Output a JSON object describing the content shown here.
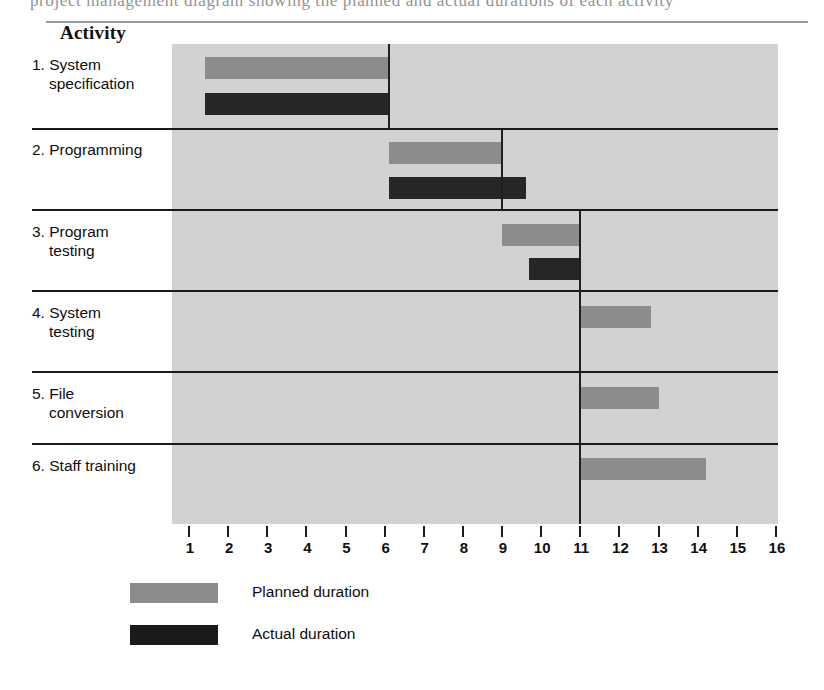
{
  "page": {
    "bleed_text": "project management diagram showing the planned and actual durations of each activity"
  },
  "header": {
    "activity_column_label": "Activity"
  },
  "legend": {
    "planned_label": "Planned duration",
    "actual_label": "Actual duration",
    "planned_color": "#8c8c8c",
    "actual_color": "#1a1a1a"
  },
  "axis": {
    "tick_labels": [
      "1",
      "2",
      "3",
      "4",
      "5",
      "6",
      "7",
      "8",
      "9",
      "10",
      "11",
      "12",
      "13",
      "14",
      "15",
      "16"
    ],
    "min": 1,
    "max": 16
  },
  "activities": [
    {
      "line1": "1. System",
      "line2": "specification"
    },
    {
      "line1": "2. Programming",
      "line2": ""
    },
    {
      "line1": "3. Program",
      "line2": "testing"
    },
    {
      "line1": "4. System",
      "line2": "testing"
    },
    {
      "line1": "5. File",
      "line2": "conversion"
    },
    {
      "line1": "6. Staff training",
      "line2": ""
    }
  ],
  "chart_data": {
    "type": "bar",
    "title": "",
    "xlabel": "",
    "ylabel": "Activity",
    "xlim": [
      1,
      16
    ],
    "grid": false,
    "legend_position": "bottom-left",
    "orientation": "horizontal",
    "categories": [
      "1. System specification",
      "2. Programming",
      "3. Program testing",
      "4. System testing",
      "5. File conversion",
      "6. Staff training"
    ],
    "series": [
      {
        "name": "Planned duration",
        "color": "#8c8c8c",
        "bars": [
          {
            "category": "1. System specification",
            "start": 1.4,
            "end": 6.1
          },
          {
            "category": "2. Programming",
            "start": 6.1,
            "end": 9.0
          },
          {
            "category": "3. Program testing",
            "start": 9.0,
            "end": 11.0
          },
          {
            "category": "4. System testing",
            "start": 11.0,
            "end": 12.8
          },
          {
            "category": "5. File conversion",
            "start": 11.0,
            "end": 13.0
          },
          {
            "category": "6. Staff training",
            "start": 11.0,
            "end": 14.2
          }
        ]
      },
      {
        "name": "Actual duration",
        "color": "#262626",
        "bars": [
          {
            "category": "1. System specification",
            "start": 1.4,
            "end": 6.1
          },
          {
            "category": "2. Programming",
            "start": 6.1,
            "end": 9.6
          },
          {
            "category": "3. Program testing",
            "start": 9.7,
            "end": 11.0
          }
        ]
      }
    ],
    "progress_line": {
      "description": "Review/status line tracing actual progress",
      "points": [
        1.4,
        6.1,
        9.0,
        11.0
      ]
    }
  }
}
